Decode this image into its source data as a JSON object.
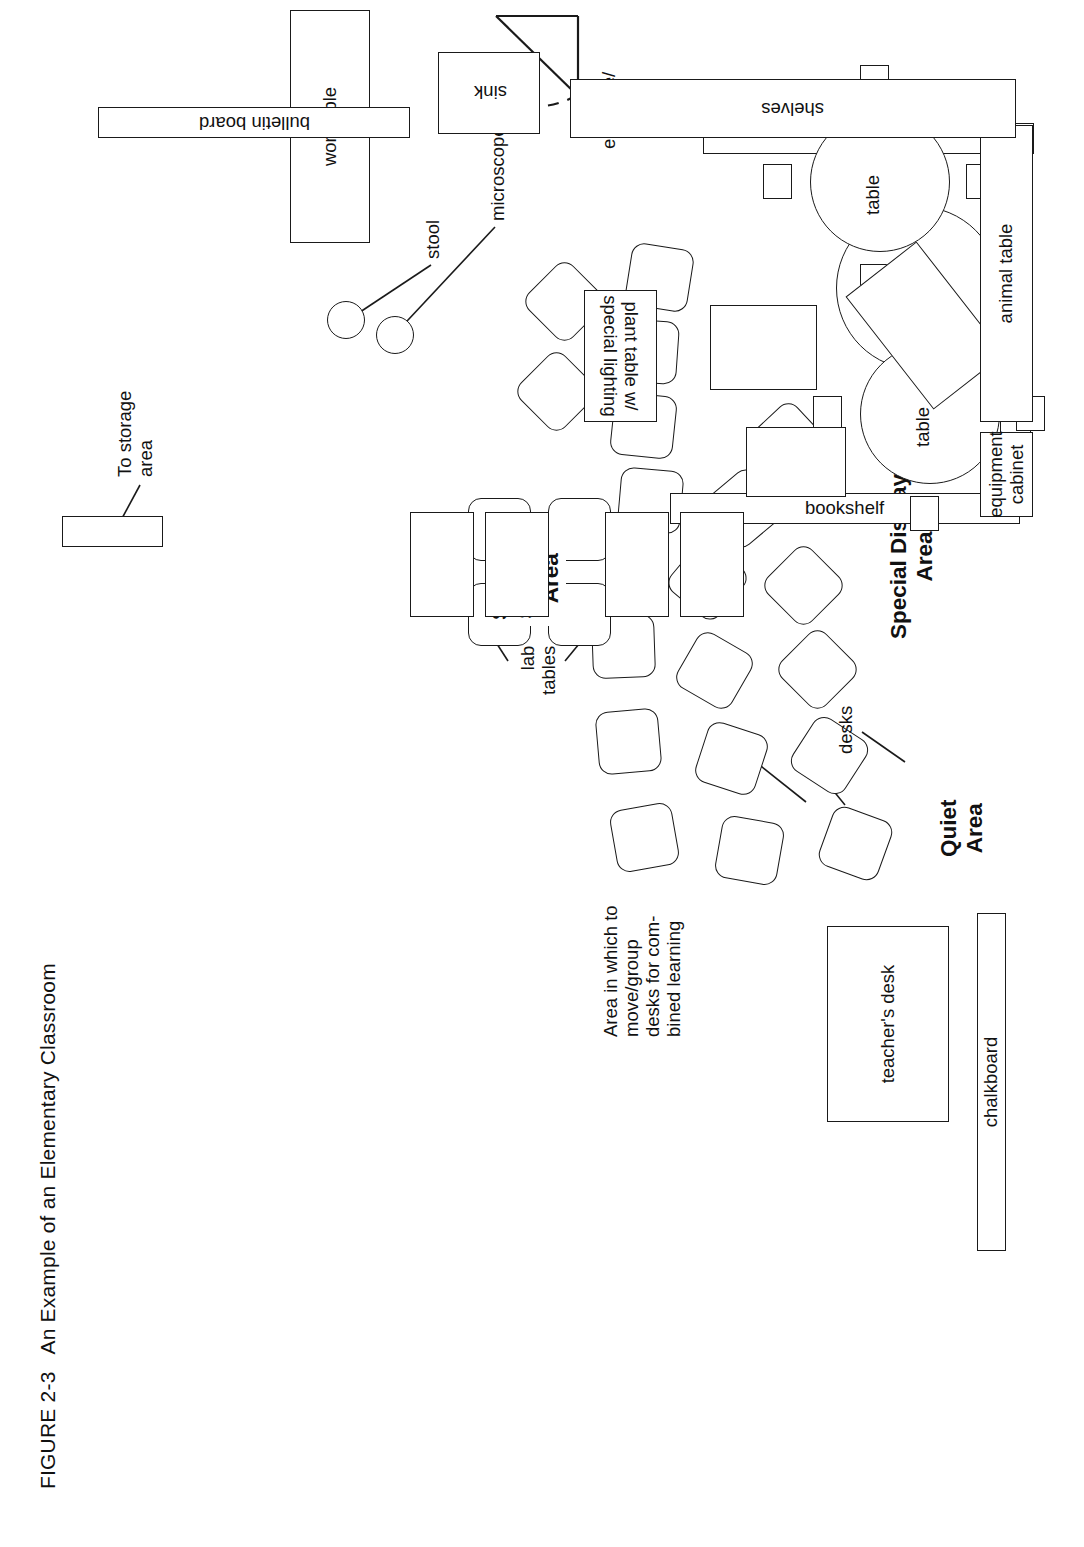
{
  "figure": {
    "number": "FIGURE 2-3",
    "title": "An Example of an Elementary Classroom",
    "caption": "FIGURE 2-3   An Example of an Elementary Classroom"
  },
  "zones": {
    "special_display": "Special Display\nArea",
    "student_seating": "Student\nSeating\nArea",
    "quiet": "Quiet\nArea",
    "combine_note": "Area in which to\nmove/group\ndesks for com-\nbined learning"
  },
  "fixtures": {
    "storage_door": "To storage\narea",
    "chalkboard": "chalkboard",
    "teachers_desk": "teacher's\ndesk",
    "bulletin_board_left": "bulletin board",
    "bulletin_board_bottom": "bulletin board",
    "entrance": "entrance/\nexit",
    "bookshelf_top": "bookshelf",
    "bookshelf_right": "bookshelf",
    "quiet_table_1": "table",
    "quiet_table_2": "table",
    "desks_label": "desks",
    "lab_tables_label": "lab\ntables",
    "animal_table": "animal table",
    "equipment_cabinet": "equipment\ncabinet",
    "plant_table": "plant table w/\nspecial lighting",
    "table_for_display": "table for\ndisplay",
    "worktable": "worktable",
    "microscope": "microscope",
    "stool": "stool",
    "sink": "sink",
    "shelves": "shelves"
  },
  "counts": {
    "student_desks": 19,
    "quiet_round_tables": 2,
    "chairs_per_round_table": 4,
    "quiet_desks": 3,
    "lab_tables": 4,
    "sink_drains": 2
  },
  "colors": {
    "ink": "#1a1a1a",
    "paper": "#ffffff"
  }
}
